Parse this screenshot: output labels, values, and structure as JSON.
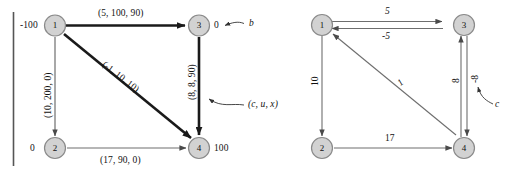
{
  "figure": {
    "caption_none": "",
    "left_graph": {
      "name": "network-flow-graph-with-cost-capacity-flow-labels",
      "nodes": [
        {
          "id": "1",
          "label": "1",
          "supply": "-100"
        },
        {
          "id": "2",
          "label": "2",
          "supply": "0"
        },
        {
          "id": "3",
          "label": "3",
          "supply": "0"
        },
        {
          "id": "4",
          "label": "4",
          "supply": "100"
        }
      ],
      "edges": [
        {
          "from": "1",
          "to": "3",
          "label": "(5, 100, 90)",
          "style": "thick"
        },
        {
          "from": "1",
          "to": "2",
          "label": "(10, 200, 0)",
          "style": "thin"
        },
        {
          "from": "1",
          "to": "4",
          "label": "(-1, 10, 10)",
          "style": "thick"
        },
        {
          "from": "3",
          "to": "4",
          "label": "(8, 8, 90)",
          "style": "thick"
        },
        {
          "from": "2",
          "to": "4",
          "label": "(17, 90, 0)",
          "style": "thin"
        }
      ],
      "annotations": [
        {
          "name": "supply-pointer-label",
          "text": "b"
        },
        {
          "name": "edge-triple-pointer-label",
          "text": "(c, u, x)"
        }
      ]
    },
    "right_graph": {
      "name": "residual-network-graph-with-reduced-costs",
      "nodes": [
        {
          "id": "1",
          "label": "1"
        },
        {
          "id": "2",
          "label": "2"
        },
        {
          "id": "3",
          "label": "3"
        },
        {
          "id": "4",
          "label": "4"
        }
      ],
      "edges": [
        {
          "from": "1",
          "to": "3",
          "label": "5"
        },
        {
          "from": "3",
          "to": "1",
          "label": "-5"
        },
        {
          "from": "1",
          "to": "2",
          "label": "10"
        },
        {
          "from": "4",
          "to": "1",
          "label": "1"
        },
        {
          "from": "2",
          "to": "4",
          "label": "17"
        },
        {
          "from": "4",
          "to": "3",
          "label": "8"
        },
        {
          "from": "3",
          "to": "4",
          "label": "-8"
        }
      ],
      "annotations": [
        {
          "name": "cost-pointer-label",
          "text": "c"
        }
      ]
    },
    "colors": {
      "node_fill": "#d2d2d2",
      "node_stroke": "#8a8a8a",
      "edge_thin": "#6e6e6e",
      "edge_thick": "#1a1a1a",
      "text": "#111111",
      "rule": "#555555"
    }
  }
}
